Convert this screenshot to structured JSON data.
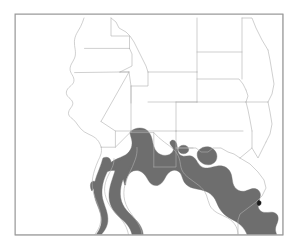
{
  "figure": {
    "type": "distribution-map",
    "title": "",
    "caption": "",
    "region_description": "Southwestern United States and northern Mexico",
    "background_color": "#ffffff",
    "frame": {
      "visible": true,
      "color": "#9a9a9a",
      "stroke_width": 1,
      "x": 15,
      "y": 14,
      "width": 268,
      "height": 221
    },
    "boundaries": {
      "description": "state and international political boundaries",
      "color": "#b0b0b0",
      "stroke_width": 0.6
    },
    "range_shading": {
      "label": "species range",
      "fill_color": "#6e6e6e",
      "stroke_color": "#6e6e6e",
      "coverage_description": "Baja California peninsula, Sonora, Sinaloa, Chihuahua, Coahuahuila, Nuevo Leon, Tamaulipas, southern Arizona, southern New Mexico, western and southern Texas, with two disjunct patches in west Texas and southern New Mexico"
    },
    "legend": {
      "visible": false,
      "entries": []
    },
    "labels": []
  },
  "chart_data": {
    "type": "map",
    "title": "",
    "xlabel": "",
    "ylabel": "",
    "projection": "equirectangular",
    "regions_shaded": [
      "Baja California",
      "Baja California Sur",
      "Sonora",
      "Sinaloa",
      "Chihuahua",
      "Coahuila",
      "Durango",
      "Nuevo Leon",
      "Tamaulipas",
      "Zacatecas",
      "southern Arizona",
      "southern New Mexico",
      "western Texas",
      "southern Texas"
    ],
    "regions_unshaded": [
      "Washington",
      "Oregon",
      "Idaho",
      "Montana",
      "North Dakota",
      "South Dakota",
      "Wyoming",
      "Nebraska",
      "California",
      "Nevada",
      "Utah",
      "Colorado",
      "Kansas",
      "northern Arizona",
      "northern New Mexico",
      "Oklahoma",
      "northern Texas"
    ],
    "shaded_color": "#6e6e6e",
    "unshaded_color": "#ffffff",
    "boundary_color": "#b0b0b0",
    "disjunct_patch_count": 2
  }
}
